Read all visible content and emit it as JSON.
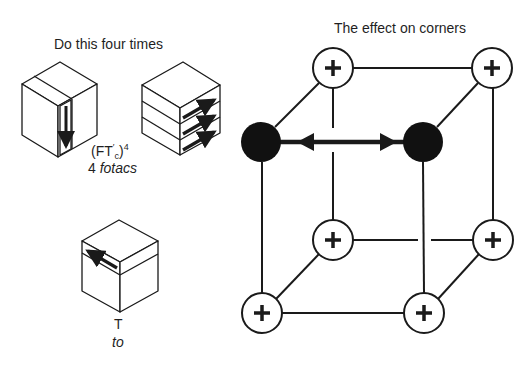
{
  "left_panel": {
    "heading": "Do this four times",
    "notation": {
      "base": "(FT",
      "prime": "′",
      "subscript": "c",
      "close": ")",
      "exponent": "4"
    },
    "caption": {
      "count": "4 ",
      "name": "fotacs"
    },
    "cube_slice_front": {
      "description": "front vertical slice turned down",
      "arrow_direction": "down"
    },
    "cube_layers": {
      "description": "three horizontal layers turned",
      "arrow_direction": "right",
      "arrow_count": 3
    },
    "cube_top": {
      "description": "top layer turned",
      "arrow_direction": "left"
    },
    "move_symbol": "T",
    "move_name": "to"
  },
  "right_panel": {
    "heading": "The effect on corners",
    "corners": [
      {
        "id": "top-back-left",
        "state": "plus",
        "symbol": "+"
      },
      {
        "id": "top-back-right",
        "state": "plus",
        "symbol": "+"
      },
      {
        "id": "top-front-left",
        "state": "swapped",
        "symbol": ""
      },
      {
        "id": "top-front-right",
        "state": "swapped",
        "symbol": ""
      },
      {
        "id": "bottom-back-left",
        "state": "plus",
        "symbol": "+"
      },
      {
        "id": "bottom-back-right",
        "state": "plus",
        "symbol": "+"
      },
      {
        "id": "bottom-front-left",
        "state": "plus",
        "symbol": "+"
      },
      {
        "id": "bottom-front-right",
        "state": "plus",
        "symbol": "+"
      }
    ],
    "swap_arrow": "double-headed arrow between top-front-left and top-front-right"
  },
  "colors": {
    "ink": "#1a1a1a",
    "background": "#ffffff",
    "swapped_fill": "#111111"
  }
}
